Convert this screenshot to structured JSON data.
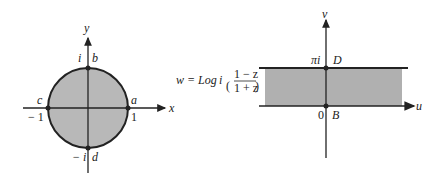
{
  "left_plane": {
    "axis_x_label": "x",
    "axis_y_label": "y",
    "point_a": "a",
    "point_b": "b",
    "point_c": "c",
    "point_d": "d",
    "tick_i": "i",
    "tick_neg_i": "− i",
    "tick_1": "1",
    "tick_neg_1": "− 1",
    "fill_color": "#b8b8b8",
    "line_color": "#222222"
  },
  "mapping": {
    "lhs": "w = Log ",
    "i": "i",
    "numerator": "1 − z",
    "denominator": "1 + z"
  },
  "right_plane": {
    "axis_u_label": "u",
    "axis_v_label": "v",
    "point_B": "B",
    "point_D": "D",
    "tick_pi_i": "πi",
    "tick_0": "0",
    "fill_color": "#b0b0b0"
  }
}
